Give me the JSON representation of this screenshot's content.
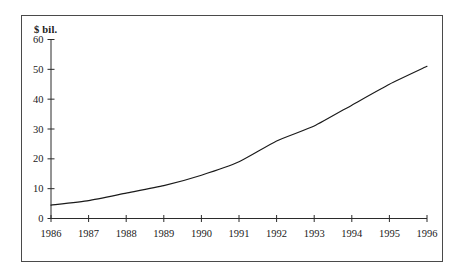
{
  "chart_data": {
    "type": "line",
    "title": "",
    "subtitle": "",
    "xlabel": "",
    "ylabel": "$ bil.",
    "unit_label": "$ bil.",
    "categories": [
      "1986",
      "1987",
      "1988",
      "1989",
      "1990",
      "1991",
      "1992",
      "1993",
      "1994",
      "1995",
      "1996"
    ],
    "x": [
      1986,
      1987,
      1988,
      1989,
      1990,
      1991,
      1992,
      1993,
      1994,
      1995,
      1996
    ],
    "values": [
      4.5,
      6,
      8.5,
      11,
      14.5,
      19,
      26,
      31,
      38,
      45,
      51
    ],
    "series": [
      {
        "name": "",
        "values": [
          4.5,
          6,
          8.5,
          11,
          14.5,
          19,
          26,
          31,
          38,
          45,
          51
        ]
      }
    ],
    "ylim": [
      0,
      60
    ],
    "xlim": [
      1986,
      1996
    ],
    "yticks": [
      0,
      10,
      20,
      30,
      40,
      50,
      60
    ],
    "ytick_labels": [
      "0",
      "10",
      "20",
      "30",
      "40",
      "50",
      "60"
    ],
    "xticks": [
      1986,
      1987,
      1988,
      1989,
      1990,
      1991,
      1992,
      1993,
      1994,
      1995,
      1996
    ],
    "xtick_labels": [
      "1986",
      "1987",
      "1988",
      "1989",
      "1990",
      "1991",
      "1992",
      "1993",
      "1994",
      "1995",
      "1996"
    ],
    "grid": false,
    "legend": false,
    "legend_position": "none",
    "annotations": [],
    "colors": {
      "line": "#1a1a1a",
      "axis": "#2b2b2b",
      "frame": "#4a4a4a",
      "background": "#ffffff",
      "text": "#1a1a1a"
    }
  }
}
